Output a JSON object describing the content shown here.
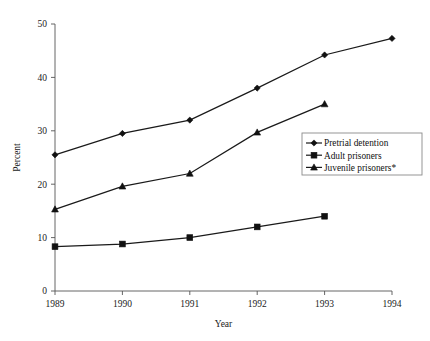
{
  "chart_data": {
    "type": "line",
    "title": "",
    "subtitle": "",
    "xlabel": "Year",
    "ylabel": "Percent",
    "categories": [
      "1989",
      "1990",
      "1991",
      "1992",
      "1993",
      "1994"
    ],
    "x": [
      1989,
      1990,
      1991,
      1992,
      1993,
      1994
    ],
    "xlim": [
      1989,
      1994
    ],
    "ylim": [
      0,
      50
    ],
    "yticks": [
      0,
      10,
      20,
      30,
      40,
      50
    ],
    "xticks": [
      "1989",
      "1990",
      "1991",
      "1992",
      "1993",
      "1994"
    ],
    "grid": false,
    "legend_position": "right-middle",
    "series": [
      {
        "name": "Pretrial detention",
        "marker": "diamond",
        "color": "#111111",
        "values": [
          25.5,
          29.5,
          32.0,
          38.0,
          44.2,
          47.3
        ]
      },
      {
        "name": "Adult prisoners",
        "marker": "square",
        "color": "#111111",
        "values": [
          8.3,
          8.8,
          10.0,
          12.0,
          14.0,
          null
        ]
      },
      {
        "name": "Juvenile prisoners*",
        "marker": "triangle",
        "color": "#111111",
        "values": [
          15.3,
          19.6,
          22.0,
          29.7,
          35.0,
          null
        ]
      }
    ]
  },
  "legend": {
    "items": [
      {
        "label": "Pretrial detention",
        "marker": "diamond"
      },
      {
        "label": "Adult prisoners",
        "marker": "square"
      },
      {
        "label": "Juvenile prisoners*",
        "marker": "triangle"
      }
    ]
  },
  "axes": {
    "y_title": "Percent",
    "x_title": "Year",
    "y_tick_labels": [
      "0",
      "10",
      "20",
      "30",
      "40",
      "50"
    ],
    "x_tick_labels": [
      "1989",
      "1990",
      "1991",
      "1992",
      "1993",
      "1994"
    ]
  },
  "colors": {
    "ink": "#111111",
    "axis": "#555555",
    "legend_border": "#8a8a8a",
    "background": "#ffffff"
  }
}
